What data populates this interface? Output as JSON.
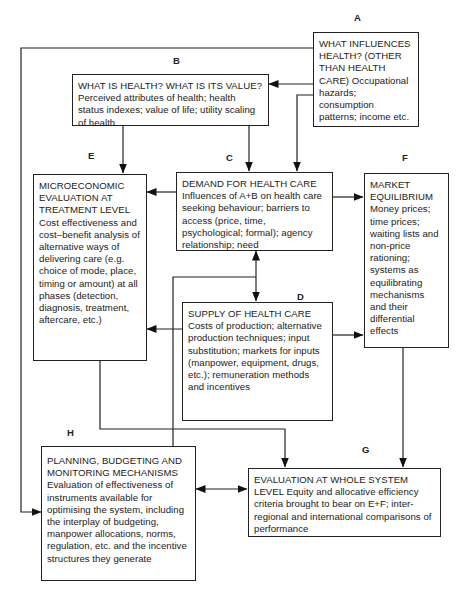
{
  "diagram": {
    "nodes": {
      "A": {
        "label": "A",
        "title": "WHAT INFLUENCES HEALTH? (OTHER THAN HEALTH CARE)",
        "body": "Occupational hazards; consumption patterns; income etc."
      },
      "B": {
        "label": "B",
        "title": "WHAT IS HEALTH?  WHAT IS ITS VALUE?",
        "body": "Perceived attributes of health; health status indexes; value of life; utility scaling of health"
      },
      "C": {
        "label": "C",
        "title": "DEMAND FOR HEALTH CARE",
        "body": "Influences of A+B on health care seeking behaviour; barriers to access (price, time, psychological; formal); agency relationship; need"
      },
      "D": {
        "label": "D",
        "title": "SUPPLY OF HEALTH CARE",
        "body": "Costs of production; alternative production techniques; input substitution; markets for inputs (manpower, equipment, drugs, etc.); remuneration methods and incentives"
      },
      "E": {
        "label": "E",
        "title": "MICROECONOMIC EVALUATION AT TREATMENT LEVEL",
        "body": "Cost effectiveness and cost–benefit analysis of alternative ways of delivering care (e.g. choice of mode, place, timing or amount) at all phases (detection, diagnosis, treatment, aftercare, etc.)"
      },
      "F": {
        "label": "F",
        "title": "MARKET EQUILIBRIUM",
        "body": "Money prices; time prices; waiting lists and non-price rationing; systems as equilibrating mechanisms and their differential effects"
      },
      "G": {
        "label": "G",
        "title": "EVALUATION AT WHOLE SYSTEM LEVEL",
        "body": "Equity and allocative efficiency criteria brought to bear on E+F; inter-regional and international comparisons of performance"
      },
      "H": {
        "label": "H",
        "title": "PLANNING, BUDGETING AND MONITORING MECHANISMS",
        "body": "Evaluation of effectiveness of instruments available for optimising the system, including the interplay of budgeting, manpower allocations, norms, regulation, etc. and the incentive structures they generate"
      }
    },
    "edges": [
      {
        "from": "A",
        "to": "B",
        "kind": "arrow"
      },
      {
        "from": "A",
        "to": "C",
        "kind": "arrow"
      },
      {
        "from": "A",
        "to": "H",
        "kind": "arrow"
      },
      {
        "from": "B",
        "to": "E",
        "kind": "arrow"
      },
      {
        "from": "B",
        "to": "C",
        "kind": "arrow"
      },
      {
        "from": "C",
        "to": "E",
        "kind": "arrow"
      },
      {
        "from": "C",
        "to": "F",
        "kind": "arrow"
      },
      {
        "from": "C",
        "to": "D",
        "kind": "bidirectional"
      },
      {
        "from": "D",
        "to": "E",
        "kind": "arrow"
      },
      {
        "from": "D",
        "to": "F",
        "kind": "arrow"
      },
      {
        "from": "E",
        "to": "G",
        "kind": "arrow"
      },
      {
        "from": "F",
        "to": "G",
        "kind": "arrow"
      },
      {
        "from": "H",
        "to": "C",
        "kind": "line"
      },
      {
        "from": "H",
        "to": "G",
        "kind": "bidirectional"
      }
    ]
  }
}
